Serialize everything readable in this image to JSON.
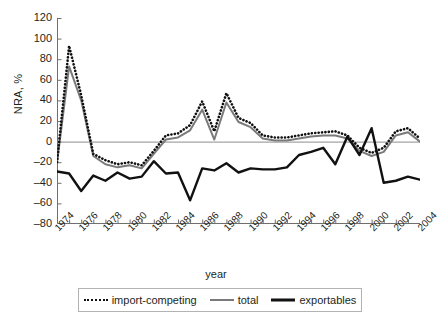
{
  "chart_data": {
    "type": "line",
    "title": "",
    "xlabel": "year",
    "ylabel": "NRA, %",
    "xlim": [
      1974,
      2004
    ],
    "ylim": [
      -80,
      120
    ],
    "ytick_step": 20,
    "xtick_step": 2,
    "grid": false,
    "legend_position": "bottom",
    "zero_line": true,
    "x": [
      1974,
      1975,
      1976,
      1977,
      1978,
      1979,
      1980,
      1981,
      1982,
      1983,
      1984,
      1985,
      1986,
      1987,
      1988,
      1989,
      1990,
      1991,
      1992,
      1993,
      1994,
      1995,
      1996,
      1997,
      1998,
      1999,
      2000,
      2001,
      2002,
      2003,
      2004
    ],
    "ytick_labels": [
      "120",
      "100",
      "80",
      "60",
      "40",
      "20",
      "0",
      "-20",
      "-40",
      "-60",
      "-80"
    ],
    "xtick_labels": [
      "1974",
      "1976",
      "1978",
      "1980",
      "1982",
      "1984",
      "1986",
      "1988",
      "1990",
      "1992",
      "1994",
      "1996",
      "1998",
      "2000",
      "2002",
      "2004"
    ],
    "series": [
      {
        "name": "import-competing",
        "style": "dotted",
        "color": "#111111",
        "width": 2,
        "values": [
          -20,
          93,
          45,
          -12,
          -18,
          -22,
          -20,
          -23,
          -9,
          6,
          8,
          16,
          39,
          10,
          47,
          23,
          18,
          6,
          4,
          4,
          6,
          8,
          9,
          10,
          6,
          -6,
          -11,
          -6,
          10,
          13,
          3
        ]
      },
      {
        "name": "total",
        "style": "solid",
        "color": "#7a7a7a",
        "width": 2,
        "values": [
          -21,
          73,
          40,
          -14,
          -22,
          -25,
          -23,
          -26,
          -12,
          2,
          4,
          11,
          31,
          2,
          38,
          19,
          14,
          3,
          1,
          1,
          3,
          5,
          6,
          6,
          3,
          -9,
          -14,
          -10,
          6,
          9,
          0
        ]
      },
      {
        "name": "exportables",
        "style": "solid",
        "color": "#111111",
        "width": 2.4,
        "values": [
          -29,
          -31,
          -48,
          -33,
          -38,
          -30,
          -36,
          -34,
          -19,
          -31,
          -30,
          -57,
          -26,
          -28,
          -21,
          -30,
          -26,
          -27,
          -27,
          -25,
          -13,
          -10,
          -6,
          -22,
          5,
          -13,
          13,
          -40,
          -38,
          -34,
          -37
        ]
      }
    ]
  },
  "axis": {
    "y_label": "NRA, %",
    "x_label": "year"
  },
  "legend": {
    "items": [
      {
        "label": "import-competing",
        "swatch": "dotted-line-icon"
      },
      {
        "label": "total",
        "swatch": "solid-gray-line-icon"
      },
      {
        "label": "exportables",
        "swatch": "solid-black-line-icon"
      }
    ]
  }
}
